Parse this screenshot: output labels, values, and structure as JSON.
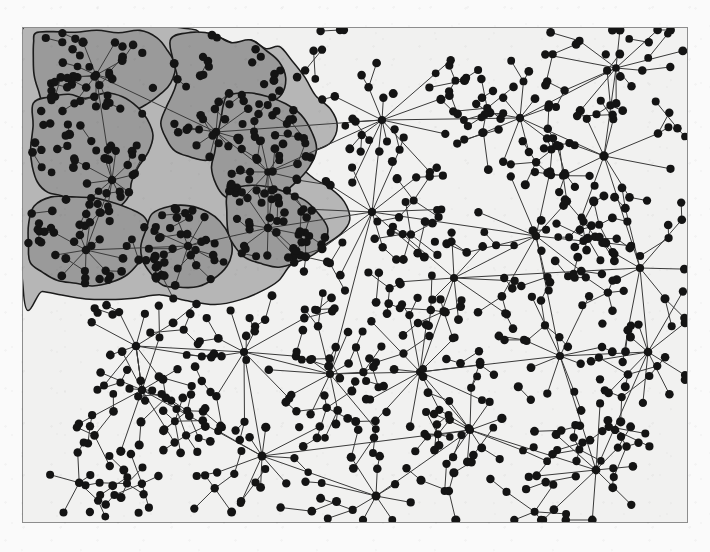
{
  "figure": {
    "type": "node-link-graph",
    "canvas": {
      "width": 710,
      "height": 552,
      "plot_x": 22,
      "plot_y": 27,
      "plot_width": 666,
      "plot_height": 496,
      "paper_color": "#fafafa",
      "plot_background": "#f1f1f0",
      "border_color": "#8d8d8d",
      "border_width": 1
    },
    "style": {
      "node_color": "#141414",
      "node_radius": 4.2,
      "edge_color": "#3a3a3a",
      "edge_width": 1,
      "hull_fill": "#b6b6b6",
      "hull_stroke": "#1d1d1d",
      "cluster_fill": "#9a9a9a",
      "cluster_stroke": "#1b1b1b",
      "cluster_stroke_width": 1.6
    },
    "legend": {
      "visible": false,
      "entries": []
    },
    "axes": {
      "visible": false,
      "x_label": "",
      "y_label": "",
      "ticks": []
    },
    "annotations": []
  },
  "chart_data": {
    "type": "scatter",
    "xlabel": "",
    "ylabel": "",
    "xlim": [
      22,
      688
    ],
    "ylim": [
      27,
      523
    ],
    "grid": false,
    "legend_position": "none",
    "counts": {
      "nodes": 606,
      "edges": 575,
      "hubs": 26,
      "clusters": 7,
      "clustered_nodes": 238
    },
    "hull": {
      "label": "cluster-union-hull",
      "fill": "#b6b6b6",
      "points": [
        [
          24,
          29
        ],
        [
          186,
          29
        ],
        [
          192,
          40
        ],
        [
          214,
          36
        ],
        [
          236,
          44
        ],
        [
          252,
          40
        ],
        [
          266,
          50
        ],
        [
          280,
          46
        ],
        [
          292,
          60
        ],
        [
          306,
          78
        ],
        [
          316,
          96
        ],
        [
          330,
          110
        ],
        [
          338,
          126
        ],
        [
          330,
          142
        ],
        [
          312,
          152
        ],
        [
          300,
          164
        ],
        [
          312,
          178
        ],
        [
          330,
          188
        ],
        [
          344,
          202
        ],
        [
          350,
          218
        ],
        [
          340,
          234
        ],
        [
          322,
          246
        ],
        [
          306,
          256
        ],
        [
          290,
          266
        ],
        [
          278,
          280
        ],
        [
          262,
          292
        ],
        [
          240,
          300
        ],
        [
          214,
          304
        ],
        [
          186,
          300
        ],
        [
          160,
          296
        ],
        [
          134,
          298
        ],
        [
          110,
          300
        ],
        [
          86,
          298
        ],
        [
          62,
          294
        ],
        [
          42,
          292
        ],
        [
          24,
          290
        ]
      ]
    },
    "clusters": [
      {
        "id": 1,
        "label": "cluster-1",
        "node_count": 34,
        "hub": [
          96,
          75
        ],
        "outline": [
          [
            36,
            34
          ],
          [
            52,
            30
          ],
          [
            74,
            32
          ],
          [
            96,
            30
          ],
          [
            118,
            34
          ],
          [
            140,
            32
          ],
          [
            158,
            38
          ],
          [
            168,
            50
          ],
          [
            176,
            66
          ],
          [
            172,
            82
          ],
          [
            160,
            94
          ],
          [
            148,
            104
          ],
          [
            132,
            110
          ],
          [
            116,
            112
          ],
          [
            100,
            108
          ],
          [
            86,
            112
          ],
          [
            72,
            116
          ],
          [
            58,
            112
          ],
          [
            46,
            104
          ],
          [
            38,
            92
          ],
          [
            34,
            76
          ],
          [
            32,
            58
          ],
          [
            34,
            44
          ]
        ]
      },
      {
        "id": 2,
        "label": "cluster-2",
        "node_count": 42,
        "hub": [
          216,
          132
        ],
        "outline": [
          [
            170,
            40
          ],
          [
            190,
            32
          ],
          [
            212,
            34
          ],
          [
            232,
            42
          ],
          [
            250,
            40
          ],
          [
            266,
            50
          ],
          [
            278,
            62
          ],
          [
            286,
            78
          ],
          [
            280,
            94
          ],
          [
            268,
            106
          ],
          [
            256,
            118
          ],
          [
            244,
            130
          ],
          [
            236,
            144
          ],
          [
            222,
            154
          ],
          [
            206,
            160
          ],
          [
            190,
            158
          ],
          [
            176,
            150
          ],
          [
            166,
            138
          ],
          [
            162,
            122
          ],
          [
            166,
            106
          ],
          [
            174,
            92
          ],
          [
            178,
            76
          ],
          [
            172,
            58
          ]
        ]
      },
      {
        "id": 3,
        "label": "cluster-3",
        "node_count": 36,
        "hub": [
          112,
          180
        ],
        "outline": [
          [
            34,
            104
          ],
          [
            50,
            96
          ],
          [
            68,
            94
          ],
          [
            86,
            98
          ],
          [
            104,
            94
          ],
          [
            122,
            98
          ],
          [
            138,
            106
          ],
          [
            148,
            120
          ],
          [
            152,
            136
          ],
          [
            148,
            152
          ],
          [
            140,
            166
          ],
          [
            132,
            180
          ],
          [
            128,
            196
          ],
          [
            118,
            208
          ],
          [
            104,
            214
          ],
          [
            88,
            212
          ],
          [
            74,
            204
          ],
          [
            62,
            196
          ],
          [
            48,
            192
          ],
          [
            38,
            182
          ],
          [
            32,
            166
          ],
          [
            30,
            148
          ],
          [
            32,
            126
          ]
        ]
      },
      {
        "id": 4,
        "label": "cluster-4",
        "node_count": 38,
        "hub": [
          268,
          172
        ],
        "outline": [
          [
            228,
            96
          ],
          [
            248,
            92
          ],
          [
            268,
            96
          ],
          [
            286,
            104
          ],
          [
            302,
            116
          ],
          [
            312,
            132
          ],
          [
            316,
            150
          ],
          [
            310,
            168
          ],
          [
            298,
            182
          ],
          [
            284,
            192
          ],
          [
            270,
            200
          ],
          [
            256,
            206
          ],
          [
            240,
            204
          ],
          [
            226,
            196
          ],
          [
            216,
            184
          ],
          [
            212,
            168
          ],
          [
            214,
            152
          ],
          [
            218,
            136
          ],
          [
            222,
            118
          ],
          [
            224,
            106
          ]
        ]
      },
      {
        "id": 5,
        "label": "cluster-5",
        "node_count": 32,
        "hub": [
          86,
          250
        ],
        "outline": [
          [
            34,
            206
          ],
          [
            52,
            198
          ],
          [
            72,
            196
          ],
          [
            92,
            198
          ],
          [
            112,
            202
          ],
          [
            130,
            208
          ],
          [
            144,
            218
          ],
          [
            150,
            232
          ],
          [
            148,
            248
          ],
          [
            140,
            262
          ],
          [
            128,
            274
          ],
          [
            112,
            282
          ],
          [
            94,
            286
          ],
          [
            76,
            284
          ],
          [
            58,
            280
          ],
          [
            42,
            274
          ],
          [
            32,
            262
          ],
          [
            28,
            244
          ],
          [
            28,
            224
          ]
        ]
      },
      {
        "id": 6,
        "label": "cluster-6",
        "node_count": 30,
        "hub": [
          188,
          246
        ],
        "outline": [
          [
            152,
            214
          ],
          [
            170,
            206
          ],
          [
            190,
            206
          ],
          [
            208,
            212
          ],
          [
            222,
            222
          ],
          [
            230,
            236
          ],
          [
            232,
            252
          ],
          [
            226,
            266
          ],
          [
            214,
            278
          ],
          [
            198,
            286
          ],
          [
            180,
            288
          ],
          [
            162,
            284
          ],
          [
            150,
            274
          ],
          [
            144,
            260
          ],
          [
            142,
            244
          ],
          [
            146,
            228
          ]
        ]
      },
      {
        "id": 7,
        "label": "cluster-7",
        "node_count": 26,
        "hub": [
          268,
          228
        ],
        "outline": [
          [
            228,
            192
          ],
          [
            248,
            186
          ],
          [
            268,
            188
          ],
          [
            288,
            194
          ],
          [
            306,
            202
          ],
          [
            320,
            214
          ],
          [
            328,
            228
          ],
          [
            326,
            242
          ],
          [
            314,
            254
          ],
          [
            298,
            262
          ],
          [
            280,
            266
          ],
          [
            262,
            264
          ],
          [
            246,
            258
          ],
          [
            234,
            246
          ],
          [
            228,
            232
          ],
          [
            226,
            212
          ]
        ]
      }
    ],
    "hubs": [
      {
        "x": 96,
        "y": 75,
        "degree": 9
      },
      {
        "x": 216,
        "y": 132,
        "degree": 8
      },
      {
        "x": 112,
        "y": 180,
        "degree": 10
      },
      {
        "x": 268,
        "y": 172,
        "degree": 9
      },
      {
        "x": 86,
        "y": 250,
        "degree": 9
      },
      {
        "x": 188,
        "y": 246,
        "degree": 8
      },
      {
        "x": 268,
        "y": 228,
        "degree": 8
      },
      {
        "x": 382,
        "y": 120,
        "degree": 11
      },
      {
        "x": 372,
        "y": 212,
        "degree": 10
      },
      {
        "x": 520,
        "y": 118,
        "degree": 9
      },
      {
        "x": 616,
        "y": 68,
        "degree": 10
      },
      {
        "x": 604,
        "y": 156,
        "degree": 8
      },
      {
        "x": 536,
        "y": 236,
        "degree": 9
      },
      {
        "x": 454,
        "y": 278,
        "degree": 8
      },
      {
        "x": 640,
        "y": 268,
        "degree": 7
      },
      {
        "x": 136,
        "y": 346,
        "degree": 9
      },
      {
        "x": 244,
        "y": 352,
        "degree": 9
      },
      {
        "x": 142,
        "y": 390,
        "degree": 8
      },
      {
        "x": 330,
        "y": 374,
        "degree": 10
      },
      {
        "x": 420,
        "y": 372,
        "degree": 11
      },
      {
        "x": 560,
        "y": 356,
        "degree": 8
      },
      {
        "x": 648,
        "y": 352,
        "degree": 9
      },
      {
        "x": 262,
        "y": 456,
        "degree": 9
      },
      {
        "x": 470,
        "y": 430,
        "degree": 10
      },
      {
        "x": 376,
        "y": 496,
        "degree": 8
      },
      {
        "x": 596,
        "y": 470,
        "degree": 8
      }
    ]
  }
}
